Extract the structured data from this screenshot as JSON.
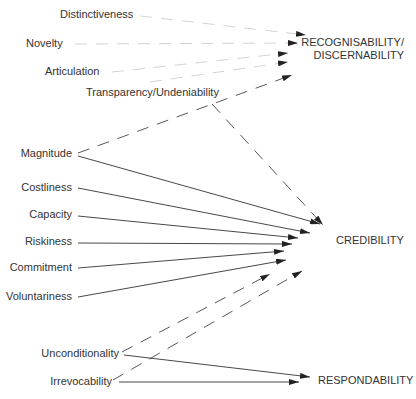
{
  "diagram": {
    "sources": [
      {
        "id": "distinctiveness",
        "label": "Distinctiveness",
        "x": 60,
        "y": 18,
        "anchor": "start"
      },
      {
        "id": "novelty",
        "label": "Novelty",
        "x": 26,
        "y": 47,
        "anchor": "start"
      },
      {
        "id": "articulation",
        "label": "Articulation",
        "x": 45,
        "y": 75,
        "anchor": "start"
      },
      {
        "id": "transparency",
        "label": "Transparency/Undeniability",
        "x": 86,
        "y": 96,
        "anchor": "start"
      },
      {
        "id": "magnitude",
        "label": "Magnitude",
        "x": 72,
        "y": 157,
        "anchor": "end"
      },
      {
        "id": "costliness",
        "label": "Costliness",
        "x": 72,
        "y": 191,
        "anchor": "end"
      },
      {
        "id": "capacity",
        "label": "Capacity",
        "x": 72,
        "y": 218,
        "anchor": "end"
      },
      {
        "id": "riskiness",
        "label": "Riskiness",
        "x": 72,
        "y": 245,
        "anchor": "end"
      },
      {
        "id": "commitment",
        "label": "Commitment",
        "x": 72,
        "y": 271,
        "anchor": "end"
      },
      {
        "id": "voluntariness",
        "label": "Voluntariness",
        "x": 72,
        "y": 300,
        "anchor": "end"
      },
      {
        "id": "unconditionality",
        "label": "Unconditionality",
        "x": 119,
        "y": 357,
        "anchor": "end"
      },
      {
        "id": "irrevocability",
        "label": "Irrevocability",
        "x": 112,
        "y": 385,
        "anchor": "end"
      }
    ],
    "targets": [
      {
        "id": "recognisability",
        "lines": [
          "RECOGNISABILITY/",
          "DISCERNABILITY"
        ],
        "x": 404,
        "y": 46,
        "anchor": "end"
      },
      {
        "id": "credibility",
        "label": "CREDIBILITY",
        "x": 336,
        "y": 244,
        "anchor": "start"
      },
      {
        "id": "respondability",
        "label": "RESPONDABILITY",
        "x": 318,
        "y": 384,
        "anchor": "start"
      }
    ],
    "edges": [
      {
        "from": "distinctiveness",
        "to": "recognisability",
        "style": "faint",
        "x1": 140,
        "y1": 16,
        "x2": 306,
        "y2": 35
      },
      {
        "from": "novelty",
        "to": "recognisability",
        "style": "faint",
        "x1": 75,
        "y1": 44,
        "x2": 298,
        "y2": 43
      },
      {
        "from": "articulation",
        "to": "recognisability",
        "style": "faint",
        "x1": 112,
        "y1": 72,
        "x2": 288,
        "y2": 53
      },
      {
        "from": "transparency",
        "to": "recognisability",
        "style": "faint",
        "x1": 150,
        "y1": 82,
        "x2": 288,
        "y2": 62
      },
      {
        "from": "magnitude",
        "to": "recognisability",
        "style": "dashed",
        "x1": 78,
        "y1": 153,
        "x2": 292,
        "y2": 75
      },
      {
        "from": "transparency",
        "to": "credibility",
        "style": "dashed",
        "x1": 212,
        "y1": 104,
        "x2": 323,
        "y2": 225
      },
      {
        "from": "magnitude",
        "to": "credibility",
        "style": "solid",
        "x1": 78,
        "y1": 156,
        "x2": 320,
        "y2": 224
      },
      {
        "from": "costliness",
        "to": "credibility",
        "style": "solid",
        "x1": 78,
        "y1": 188,
        "x2": 310,
        "y2": 233
      },
      {
        "from": "capacity",
        "to": "credibility",
        "style": "solid",
        "x1": 78,
        "y1": 216,
        "x2": 298,
        "y2": 238
      },
      {
        "from": "riskiness",
        "to": "credibility",
        "style": "solid",
        "x1": 78,
        "y1": 243,
        "x2": 292,
        "y2": 244
      },
      {
        "from": "commitment",
        "to": "credibility",
        "style": "solid",
        "x1": 78,
        "y1": 268,
        "x2": 284,
        "y2": 251
      },
      {
        "from": "voluntariness",
        "to": "credibility",
        "style": "solid",
        "x1": 78,
        "y1": 297,
        "x2": 286,
        "y2": 260
      },
      {
        "from": "unconditionality",
        "to": "credibility",
        "style": "dashed",
        "x1": 122,
        "y1": 352,
        "x2": 270,
        "y2": 274
      },
      {
        "from": "irrevocability",
        "to": "credibility",
        "style": "dashed",
        "x1": 113,
        "y1": 380,
        "x2": 302,
        "y2": 271
      },
      {
        "from": "unconditionality",
        "to": "respondability",
        "style": "solid",
        "x1": 124,
        "y1": 355,
        "x2": 310,
        "y2": 377
      },
      {
        "from": "irrevocability",
        "to": "respondability",
        "style": "solid",
        "x1": 119,
        "y1": 382,
        "x2": 299,
        "y2": 382
      }
    ]
  }
}
